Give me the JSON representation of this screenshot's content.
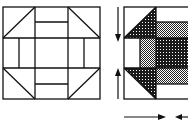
{
  "diagram": {
    "colors": {
      "line": "#111111",
      "background": "#ffffff",
      "dark_print": "#1a1a1a",
      "light_print": "#9a9a9a"
    },
    "left_block": {
      "description": "Outline block: 3x3 grid with corner half-square triangles and split side rectangles",
      "corners": [
        "half-square-triangle",
        "half-square-triangle",
        "half-square-triangle",
        "half-square-triangle"
      ],
      "sides": [
        "two-strip rectangle",
        "two-strip rectangle",
        "two-strip rectangle",
        "two-strip rectangle"
      ],
      "center": "plain square"
    },
    "right_block": {
      "description": "Partially shaded block showing pressing / assembly",
      "shaded_pieces": [
        "top-left triangle (dark print)",
        "bottom-left triangle (dark print)",
        "top strip (light check)",
        "center (dark print)",
        "left inner strip (light check)",
        "bottom strip (light check)"
      ]
    },
    "arrows": [
      {
        "name": "arrow-down",
        "direction": "down"
      },
      {
        "name": "arrow-up",
        "direction": "up"
      },
      {
        "name": "arrow-right",
        "direction": "right"
      },
      {
        "name": "arrow-left",
        "direction": "left"
      }
    ]
  }
}
